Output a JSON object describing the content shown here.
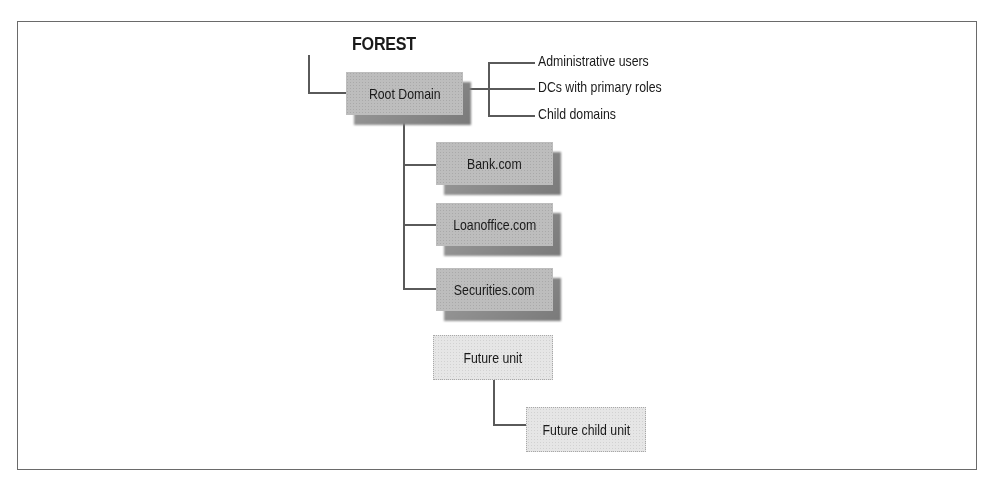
{
  "diagram": {
    "title": "FOREST",
    "root": {
      "label": "Root Domain",
      "attributes": [
        "Administrative users",
        "DCs with primary roles",
        "Child domains"
      ]
    },
    "children": [
      {
        "label": "Bank.com"
      },
      {
        "label": "Loanoffice.com"
      },
      {
        "label": "Securities.com"
      }
    ],
    "future": {
      "label": "Future unit",
      "child": {
        "label": "Future child unit"
      }
    }
  },
  "colors": {
    "node_fill": "#bdbdbd",
    "node_shadow": "#7a7a7a",
    "future_fill": "#e6e6e6",
    "line": "#5a5a5a",
    "frame": "#6a6a6a"
  }
}
